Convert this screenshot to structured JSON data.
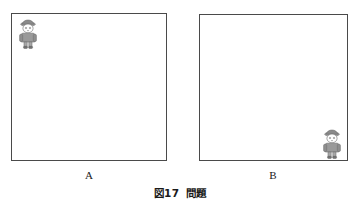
{
  "figure": {
    "caption_number": "図17",
    "caption_title": "問題",
    "panels": [
      {
        "id": "A",
        "label": "A",
        "person_position": "top-left",
        "person_icon": "child-figure-icon"
      },
      {
        "id": "B",
        "label": "B",
        "person_position": "bottom-right",
        "person_icon": "child-figure-icon"
      }
    ]
  },
  "colors": {
    "page_background": "#ffffff",
    "panel_border": "#4a4a4a",
    "panel_fill": "#ffffff",
    "text": "#1a1a1a",
    "person_hat": "#8a8a8a",
    "person_coat": "#9a9a9a",
    "person_skin": "#fdfdfd",
    "person_outline": "#6e6e6e"
  }
}
